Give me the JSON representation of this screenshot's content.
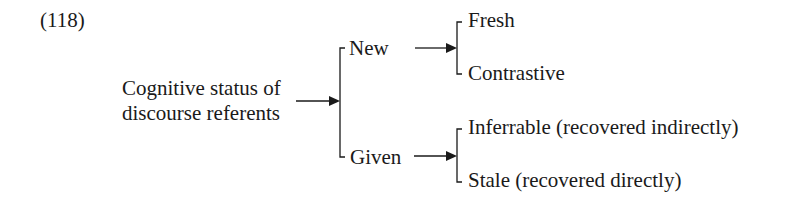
{
  "example_number": "(118)",
  "root": {
    "line1": "Cognitive status of",
    "line2": "discourse referents"
  },
  "branches": [
    {
      "label": "New",
      "children": [
        "Fresh",
        "Contrastive"
      ]
    },
    {
      "label": "Given",
      "children": [
        "Inferrable (recovered indirectly)",
        "Stale (recovered directly)"
      ]
    }
  ],
  "colors": {
    "text": "#1a1a1a",
    "line": "#1a1a1a",
    "background": "#ffffff"
  }
}
